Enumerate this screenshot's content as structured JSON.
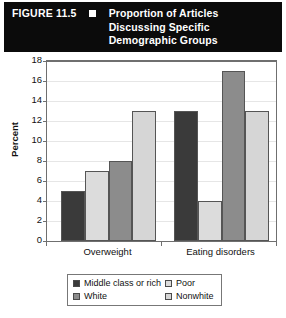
{
  "figure": {
    "number_label": "FIGURE 11.5",
    "bullet_icon": "square-bullet-icon",
    "title_lines": [
      "Proportion of Articles",
      "Discussing Specific",
      "Demographic Groups"
    ],
    "banner_background": "#0b0b0b",
    "banner_text_color": "#ffffff"
  },
  "chart_data": {
    "type": "bar",
    "title": "Proportion of Articles Discussing Specific Demographic Groups",
    "xlabel": "",
    "ylabel": "Percent",
    "categories": [
      "Overweight",
      "Eating disorders"
    ],
    "series": [
      {
        "name": "Middle class or rich",
        "values": [
          5,
          13
        ],
        "color": "#3a3a3a"
      },
      {
        "name": "Poor",
        "values": [
          7,
          4
        ],
        "color": "#dcdcdc"
      },
      {
        "name": "White",
        "values": [
          8,
          17
        ],
        "color": "#8c8c8c"
      },
      {
        "name": "Nonwhite",
        "values": [
          13,
          13
        ],
        "color": "#d6d6d6"
      }
    ],
    "ylim": [
      0,
      18
    ],
    "yticks": [
      0,
      2,
      4,
      6,
      8,
      10,
      12,
      14,
      16,
      18
    ],
    "ytick_labels": [
      "0",
      "2",
      "4",
      "6",
      "8",
      "10",
      "12",
      "14",
      "16",
      "18"
    ],
    "grid": true,
    "legend_position": "bottom"
  }
}
